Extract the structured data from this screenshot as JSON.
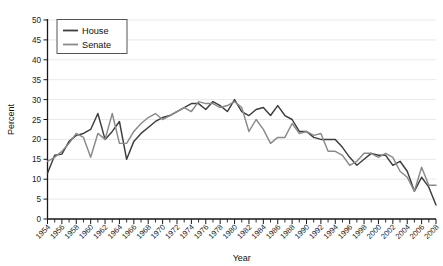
{
  "chart_data": {
    "type": "line",
    "title": "",
    "xlabel": "Year",
    "ylabel": "Percent",
    "xlim": [
      1954,
      2008
    ],
    "ylim": [
      0,
      50
    ],
    "ytick_step": 5,
    "xtick_step": 2,
    "grid": true,
    "legend_position": "top-left",
    "x": [
      1954,
      1955,
      1956,
      1957,
      1958,
      1959,
      1960,
      1961,
      1962,
      1963,
      1964,
      1965,
      1966,
      1967,
      1968,
      1969,
      1970,
      1971,
      1972,
      1973,
      1974,
      1975,
      1976,
      1977,
      1978,
      1979,
      1980,
      1981,
      1982,
      1983,
      1984,
      1985,
      1986,
      1987,
      1988,
      1989,
      1990,
      1991,
      1992,
      1993,
      1994,
      1995,
      1996,
      1997,
      1998,
      1999,
      2000,
      2001,
      2002,
      2003,
      2004,
      2005,
      2006,
      2007,
      2008
    ],
    "series": [
      {
        "name": "House",
        "color": "#3d3d3d",
        "values": [
          11.5,
          16.0,
          16.3,
          19.5,
          21.0,
          21.5,
          22.5,
          26.5,
          20.0,
          22.0,
          24.5,
          15.0,
          19.5,
          21.5,
          23.0,
          24.5,
          25.5,
          26.0,
          27.0,
          28.0,
          29.0,
          29.0,
          27.5,
          29.5,
          28.5,
          27.0,
          30.0,
          27.0,
          26.0,
          27.5,
          28.0,
          26.0,
          28.5,
          26.0,
          25.0,
          22.0,
          22.0,
          20.5,
          20.0,
          20.0,
          20.0,
          18.0,
          15.5,
          13.5,
          15.0,
          16.5,
          16.0,
          16.0,
          13.5,
          14.5,
          12.0,
          7.0,
          10.5,
          8.0,
          3.5
        ],
        "ylabel_note": "percent"
      },
      {
        "name": "Senate",
        "color": "#8a8a8a",
        "values": [
          14.5,
          15.5,
          17.0,
          19.0,
          21.5,
          20.5,
          15.5,
          21.5,
          20.0,
          26.5,
          19.0,
          19.0,
          22.0,
          24.0,
          25.5,
          26.5,
          25.0,
          26.0,
          27.0,
          28.0,
          27.0,
          29.5,
          29.0,
          29.0,
          28.0,
          28.5,
          29.5,
          28.0,
          22.0,
          25.0,
          22.5,
          19.0,
          20.5,
          20.5,
          24.0,
          21.5,
          22.0,
          21.0,
          21.5,
          17.0,
          17.0,
          16.0,
          13.5,
          14.5,
          16.5,
          16.5,
          15.5,
          16.5,
          15.5,
          12.0,
          10.5,
          7.0,
          13.0,
          8.5,
          8.5
        ]
      }
    ],
    "ytick_labels": [
      "0",
      "5",
      "10",
      "15",
      "20",
      "25",
      "30",
      "35",
      "40",
      "45",
      "50"
    ],
    "xtick_labels": [
      "1954",
      "1956",
      "1958",
      "1960",
      "1962",
      "1964",
      "1966",
      "1968",
      "1970",
      "1972",
      "1974",
      "1976",
      "1978",
      "1980",
      "1982",
      "1984",
      "1986",
      "1988",
      "1990",
      "1992",
      "1994",
      "1996",
      "1998",
      "2000",
      "2002",
      "2004",
      "2006",
      "2008"
    ]
  },
  "legend": {
    "items": [
      {
        "label": "House"
      },
      {
        "label": "Senate"
      }
    ]
  },
  "axes": {
    "x_title": "Year",
    "y_title": "Percent"
  }
}
